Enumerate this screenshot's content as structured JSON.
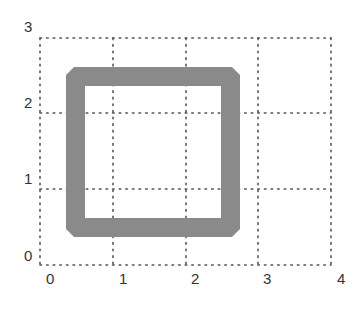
{
  "figure": {
    "type": "grid-diagram",
    "grid": {
      "x_range": [
        0,
        4
      ],
      "y_range": [
        0,
        3
      ],
      "line_style": "dotted",
      "line_color": "#555555"
    },
    "x_ticks": [
      "0",
      "1",
      "2",
      "3",
      "4"
    ],
    "y_ticks": [
      "0",
      "1",
      "2",
      "3"
    ],
    "shape": {
      "kind": "square-frame",
      "fill_color": "#8a8a8a",
      "outer": {
        "x0": 0.36,
        "y0": 0.37,
        "x1": 2.75,
        "y1": 2.6
      },
      "inner": {
        "x0": 0.62,
        "y0": 0.62,
        "x1": 2.49,
        "y1": 2.35
      },
      "corner_bevel": true
    }
  }
}
